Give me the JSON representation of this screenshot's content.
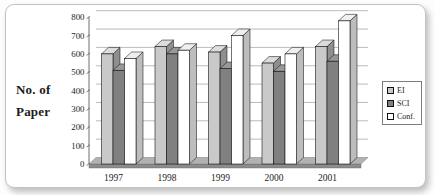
{
  "chart_data": {
    "type": "bar",
    "effect": "3d-clustered-column",
    "title": "No. of Paper",
    "title_lines": [
      "No. of",
      "Paper"
    ],
    "categories": [
      "1997",
      "1998",
      "1999",
      "2000",
      "2001"
    ],
    "series": [
      {
        "name": "EI",
        "color": "#c9c9c9",
        "top_color": "#dcdcdc",
        "side_color": "#8f8f8f",
        "values": [
          600,
          640,
          610,
          550,
          640
        ]
      },
      {
        "name": "SCI",
        "color": "#808080",
        "top_color": "#989898",
        "side_color": "#595959",
        "values": [
          510,
          600,
          520,
          505,
          560
        ]
      },
      {
        "name": "Conf.",
        "color": "#ffffff",
        "top_color": "#efefef",
        "side_color": "#bdbdbd",
        "values": [
          575,
          620,
          700,
          600,
          780
        ]
      }
    ],
    "xlabel": "",
    "ylabel": "No. of Paper",
    "ylim": [
      0,
      800
    ],
    "ytick_step": 100,
    "grid": true,
    "legend_position": "right",
    "colors": {
      "grid": "#9e9e9e",
      "axis": "#4a4a4a",
      "floor_top": "#b2b2b2",
      "floor_front": "#8c8c8c",
      "text": "#1c1c1c",
      "bar_stroke": "#141414"
    }
  }
}
